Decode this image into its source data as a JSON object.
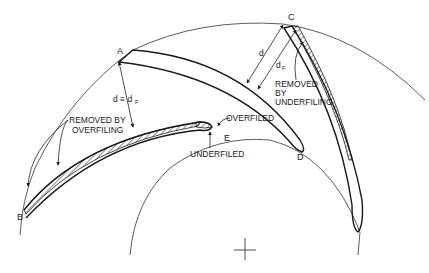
{
  "figure": {
    "points": {
      "A": "A",
      "B": "B",
      "C": "C",
      "D": "D",
      "E": "E"
    },
    "labels": {
      "d_equiv": "d ≡ d",
      "d_equiv_sub": "F",
      "d": "d",
      "d_f": "d",
      "d_f_sub": "F",
      "removed_overfiling_line1": "REMOVED BY",
      "removed_overfiling_line2": "OVERFILING",
      "removed_underfiling_line1": "REMOVED",
      "removed_underfiling_line2": "BY",
      "removed_underfiling_line3": "UNDERFILING",
      "overfiled": "OVERFILED",
      "underfiled": "UNDERFILED"
    },
    "elements": {
      "outer_circle": "outer-circle",
      "inner_circle": "inner-circle",
      "center_mark": "center-crosshair"
    }
  }
}
